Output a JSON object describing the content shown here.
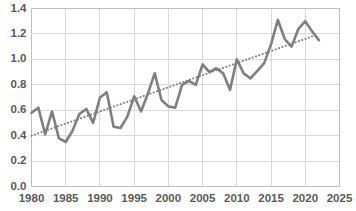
{
  "chart_data": {
    "type": "line",
    "title": "",
    "xlabel": "",
    "ylabel": "",
    "xlim": [
      1980,
      2025
    ],
    "ylim": [
      0.0,
      1.4
    ],
    "grid": true,
    "legend": null,
    "xticks": [
      "1980",
      "1985",
      "1990",
      "1995",
      "2000",
      "2005",
      "2010",
      "2015",
      "2020",
      "2025"
    ],
    "yticks": [
      "0.0",
      "0.2",
      "0.4",
      "0.6",
      "0.8",
      "1.0",
      "1.2",
      "1.4"
    ],
    "series": [
      {
        "name": "Annual value",
        "style": "solid",
        "color": "#7f7f7f",
        "x": [
          1980,
          1981,
          1982,
          1983,
          1984,
          1985,
          1986,
          1987,
          1988,
          1989,
          1990,
          1991,
          1992,
          1993,
          1994,
          1995,
          1996,
          1997,
          1998,
          1999,
          2000,
          2001,
          2002,
          2003,
          2004,
          2005,
          2006,
          2007,
          2008,
          2009,
          2010,
          2011,
          2012,
          2013,
          2014,
          2015,
          2016,
          2017,
          2018,
          2019,
          2020,
          2021,
          2022
        ],
        "values": [
          0.58,
          0.62,
          0.41,
          0.59,
          0.38,
          0.35,
          0.44,
          0.57,
          0.61,
          0.5,
          0.7,
          0.74,
          0.47,
          0.46,
          0.55,
          0.71,
          0.59,
          0.73,
          0.89,
          0.68,
          0.63,
          0.62,
          0.8,
          0.83,
          0.8,
          0.96,
          0.9,
          0.93,
          0.89,
          0.76,
          1.0,
          0.89,
          0.85,
          0.91,
          0.97,
          1.12,
          1.31,
          1.16,
          1.1,
          1.24,
          1.3,
          1.22,
          1.15
        ]
      },
      {
        "name": "Linear trend",
        "style": "dotted",
        "color": "#7f7f7f",
        "x": [
          1980,
          2021
        ],
        "values": [
          0.4,
          1.18
        ]
      }
    ]
  },
  "axes": {
    "y_tick_labels": [
      "1.4",
      "1.2",
      "1.0",
      "0.8",
      "0.6",
      "0.4",
      "0.2",
      "0.0"
    ],
    "x_tick_labels": [
      "1980",
      "1985",
      "1990",
      "1995",
      "2000",
      "2005",
      "2010",
      "2015",
      "2020",
      "2025"
    ]
  },
  "colors": {
    "series_line": "#7f7f7f",
    "trend_line": "#7f7f7f",
    "grid": "#d9d9d9",
    "plot_border": "#bfbfbf",
    "tick_text": "#595959",
    "background": "#ffffff"
  }
}
